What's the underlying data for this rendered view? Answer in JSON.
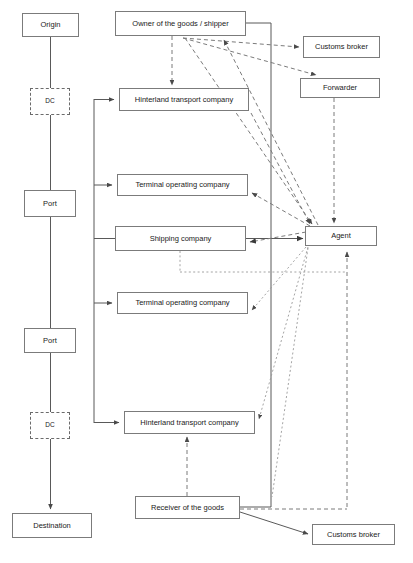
{
  "diagram": {
    "canvas": {
      "width": 413,
      "height": 563
    },
    "colors": {
      "node_border": "#7b7b7b",
      "node_fill": "#ffffff",
      "text": "#1a1a1a",
      "solid_edge": "#595959",
      "dashed_edge": "#7b7b7b",
      "dotted_edge": "#9a9a9a"
    },
    "physical_chain": {
      "name": "physical-flow-column",
      "nodes": [
        {
          "id": "origin",
          "label": "Origin",
          "x": 22,
          "y": 13,
          "w": 57,
          "h": 24,
          "style": "solid",
          "font": 7.5
        },
        {
          "id": "dc_origin",
          "label": "DC",
          "x": 30,
          "y": 88,
          "w": 40,
          "h": 27,
          "style": "dashed",
          "font": 6.5
        },
        {
          "id": "port_origin",
          "label": "Port",
          "x": 24,
          "y": 190,
          "w": 52,
          "h": 27,
          "style": "solid",
          "font": 7.5
        },
        {
          "id": "port_destination",
          "label": "Port",
          "x": 24,
          "y": 328,
          "w": 52,
          "h": 25,
          "style": "solid",
          "font": 7.5
        },
        {
          "id": "dc_destination",
          "label": "DC",
          "x": 30,
          "y": 412,
          "w": 40,
          "h": 27,
          "style": "dashed",
          "font": 6.5
        },
        {
          "id": "destination",
          "label": "Destination",
          "x": 12,
          "y": 513,
          "w": 80,
          "h": 25,
          "style": "solid",
          "font": 7.5
        }
      ]
    },
    "actors": {
      "name": "actor-nodes",
      "nodes": [
        {
          "id": "owner_shipper",
          "label": "Owner of the goods / shipper",
          "x": 115,
          "y": 11,
          "w": 131,
          "h": 25,
          "style": "solid",
          "font": 7.5
        },
        {
          "id": "hinterland_1",
          "label": "Hinterland transport company",
          "x": 119,
          "y": 88,
          "w": 130,
          "h": 23,
          "style": "solid",
          "font": 7.5
        },
        {
          "id": "terminal_1",
          "label": "Terminal operating company",
          "x": 117,
          "y": 174,
          "w": 131,
          "h": 22,
          "style": "solid",
          "font": 7.5
        },
        {
          "id": "shipping_company",
          "label": "Shipping company",
          "x": 115,
          "y": 226,
          "w": 131,
          "h": 25,
          "style": "solid",
          "font": 7.5
        },
        {
          "id": "terminal_2",
          "label": "Terminal operating company",
          "x": 117,
          "y": 292,
          "w": 131,
          "h": 22,
          "style": "solid",
          "font": 7.5
        },
        {
          "id": "hinterland_2",
          "label": "Hinterland transport company",
          "x": 124,
          "y": 411,
          "w": 131,
          "h": 23,
          "style": "solid",
          "font": 7.5
        },
        {
          "id": "receiver",
          "label": "Receiver of the goods",
          "x": 135,
          "y": 496,
          "w": 105,
          "h": 23,
          "style": "solid",
          "font": 7.5
        },
        {
          "id": "customs_broker_top",
          "label": "Customs broker",
          "x": 303,
          "y": 36,
          "w": 77,
          "h": 22,
          "style": "solid",
          "font": 7.5
        },
        {
          "id": "forwarder",
          "label": "Forwarder",
          "x": 300,
          "y": 78,
          "w": 80,
          "h": 20,
          "style": "solid",
          "font": 7.5
        },
        {
          "id": "agent",
          "label": "Agent",
          "x": 305,
          "y": 226,
          "w": 72,
          "h": 20,
          "style": "solid",
          "font": 7.5
        },
        {
          "id": "customs_broker_bottom",
          "label": "Customs broker",
          "x": 312,
          "y": 524,
          "w": 83,
          "h": 21,
          "style": "solid",
          "font": 7.5
        }
      ]
    },
    "edges": [
      {
        "from": "origin",
        "to": "dc_origin",
        "style": "solid",
        "arrow": false
      },
      {
        "from": "dc_origin",
        "to": "port_origin",
        "style": "solid",
        "arrow": false
      },
      {
        "from": "port_origin",
        "to": "port_destination",
        "style": "solid",
        "arrow": false
      },
      {
        "from": "port_destination",
        "to": "dc_destination",
        "style": "solid",
        "arrow": false
      },
      {
        "from": "dc_destination",
        "to": "destination",
        "style": "solid",
        "arrow": true
      },
      {
        "from": "owner_shipper",
        "to": "hinterland_1",
        "style": "dashed",
        "arrow": true
      },
      {
        "from": "owner_shipper",
        "to": "customs_broker_top",
        "style": "dashed",
        "arrow": true
      },
      {
        "from": "owner_shipper",
        "to": "forwarder",
        "style": "dashed",
        "arrow": true
      },
      {
        "from": "owner_shipper",
        "to": "agent",
        "style": "dashed",
        "arrow": true
      },
      {
        "from": "forwarder",
        "to": "agent",
        "style": "dashed",
        "arrow": true
      },
      {
        "from": "agent",
        "to": "owner_shipper",
        "style": "dashed",
        "arrow": true
      },
      {
        "from": "agent",
        "to": "terminal_1",
        "style": "dashed",
        "arrow": true
      },
      {
        "from": "agent",
        "to": "shipping_company",
        "style": "dashed",
        "arrow": true
      },
      {
        "from": "agent",
        "to": "terminal_2",
        "style": "dotted",
        "arrow": true
      },
      {
        "from": "agent",
        "to": "hinterland_2",
        "style": "dotted",
        "arrow": true
      },
      {
        "from": "hinterland_1",
        "to": "agent",
        "style": "dashed",
        "arrow": true
      },
      {
        "from": "shipping_company",
        "to": "agent",
        "style": "solid",
        "arrow": true
      },
      {
        "from": "receiver",
        "to": "hinterland_2",
        "style": "dotted",
        "arrow": true
      },
      {
        "from": "receiver",
        "to": "customs_broker_bottom",
        "style": "solid",
        "arrow": true
      },
      {
        "from": "receiver",
        "to": "agent",
        "style": "solid",
        "arrow": false
      },
      {
        "from": "receiver",
        "to": "forwarder",
        "style": "dotted",
        "arrow": true
      },
      {
        "from": "spine",
        "to": "hinterland_1",
        "style": "solid",
        "arrow": true
      },
      {
        "from": "spine",
        "to": "terminal_1",
        "style": "solid",
        "arrow": true
      },
      {
        "from": "spine",
        "to": "shipping_company",
        "style": "solid",
        "arrow": false
      },
      {
        "from": "spine",
        "to": "terminal_2",
        "style": "solid",
        "arrow": true
      },
      {
        "from": "spine",
        "to": "hinterland_2",
        "style": "solid",
        "arrow": true
      }
    ]
  }
}
